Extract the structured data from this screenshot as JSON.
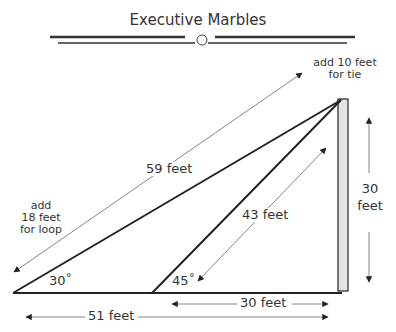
{
  "title": "Executive Marbles",
  "labels": {
    "tie_note": "add 10 feet\nfor tie",
    "tie_line1": "add 10 feet",
    "tie_line2": "for tie",
    "loop_line1": "add",
    "loop_line2": "18 feet",
    "loop_line3": "for loop",
    "long_rope": "59 feet",
    "short_rope": "43 feet",
    "pole_height_1": "30",
    "pole_height_2": "feet",
    "angle_long": "30˚",
    "angle_short": "45˚",
    "base_short": "30 feet",
    "base_long": "51 feet"
  },
  "colors": {
    "line": "#222222",
    "thin_line": "#555555",
    "pole_fill": "#e4e4e4"
  }
}
